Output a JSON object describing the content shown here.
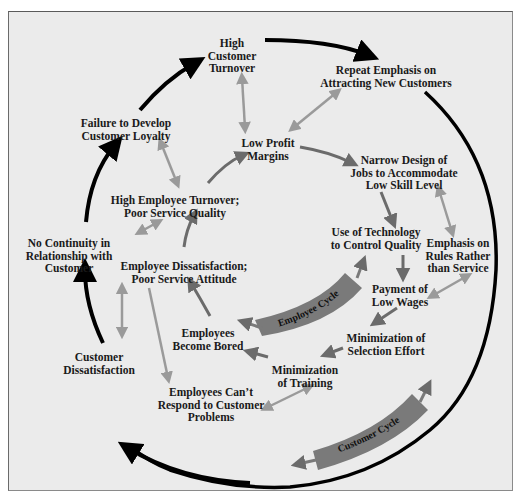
{
  "diagram": {
    "title": "",
    "colors": {
      "background": "#ebebeb",
      "border": "#8a8a8a",
      "outer_arrow": "#000000",
      "inner_arrow_dark": "#6b6b6b",
      "inner_arrow_light": "#9a9a9a",
      "cycle_band": "#7a7a7a",
      "text": "#1a1a1a"
    },
    "cycles": {
      "employee": {
        "label": "Employee Cycle"
      },
      "customer": {
        "label": "Customer Cycle"
      }
    },
    "nodes": {
      "high_customer_turnover": {
        "lines": [
          "High",
          "Customer",
          "Turnover"
        ]
      },
      "repeat_emphasis": {
        "lines": [
          "Repeat Emphasis on",
          "Attracting New Customers"
        ]
      },
      "failure_loyalty": {
        "lines": [
          "Failure to Develop",
          "Customer Loyalty"
        ]
      },
      "low_profit_margins": {
        "lines": [
          "Low Profit",
          "Margins"
        ]
      },
      "narrow_design": {
        "lines": [
          "Narrow Design of",
          "Jobs to Accommodate",
          "Low Skill Level"
        ]
      },
      "high_employee_turnover": {
        "lines": [
          "High Employee Turnover;",
          "Poor Service Quality"
        ]
      },
      "use_of_technology": {
        "lines": [
          "Use of Technology",
          "to Control Quality"
        ]
      },
      "emphasis_rules": {
        "lines": [
          "Emphasis on",
          "Rules Rather",
          "than Service"
        ]
      },
      "no_continuity": {
        "lines": [
          "No Continuity in",
          "Relationship with",
          "Customer"
        ]
      },
      "employee_dissatisfaction": {
        "lines": [
          "Employee Dissatisfaction;",
          "Poor Service Attitude"
        ]
      },
      "payment_low_wages": {
        "lines": [
          "Payment of",
          "Low Wages"
        ]
      },
      "employees_bored": {
        "lines": [
          "Employees",
          "Become Bored"
        ]
      },
      "minimization_selection": {
        "lines": [
          "Minimization of",
          "Selection Effort"
        ]
      },
      "customer_dissatisfaction": {
        "lines": [
          "Customer",
          "Dissatisfaction"
        ]
      },
      "minimization_training": {
        "lines": [
          "Minimization",
          "of Training"
        ]
      },
      "employees_cant_respond": {
        "lines": [
          "Employees Can’t",
          "Respond to Customer",
          "Problems"
        ]
      }
    }
  }
}
